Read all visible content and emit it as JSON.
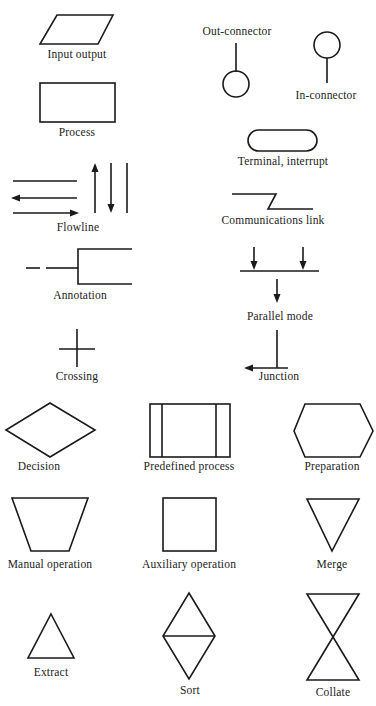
{
  "diagram": {
    "stroke_color": "#1a1a1a",
    "background": "#ffffff",
    "symbols": [
      {
        "id": "input-output",
        "label": "Input output",
        "shape": "parallelogram"
      },
      {
        "id": "out-connector",
        "label": "Out-connector",
        "shape": "line-above-circle"
      },
      {
        "id": "in-connector",
        "label": "In-connector",
        "shape": "circle-above-line"
      },
      {
        "id": "process",
        "label": "Process",
        "shape": "rectangle"
      },
      {
        "id": "terminal",
        "label": "Terminal, interrupt",
        "shape": "rounded-rectangle"
      },
      {
        "id": "flowline",
        "label": "Flowline",
        "shape": "lines-with-arrows"
      },
      {
        "id": "communications-link",
        "label": "Communications link",
        "shape": "zigzag-line"
      },
      {
        "id": "annotation",
        "label": "Annotation",
        "shape": "dashed-line-bracket"
      },
      {
        "id": "parallel-mode",
        "label": "Parallel mode",
        "shape": "arrows-to-bar"
      },
      {
        "id": "crossing",
        "label": "Crossing",
        "shape": "cross"
      },
      {
        "id": "junction",
        "label": "Junction",
        "shape": "t-junction-arrow"
      },
      {
        "id": "decision",
        "label": "Decision",
        "shape": "diamond"
      },
      {
        "id": "predefined-process",
        "label": "Predefined process",
        "shape": "rectangle-double-sides"
      },
      {
        "id": "preparation",
        "label": "Preparation",
        "shape": "hexagon"
      },
      {
        "id": "manual-operation",
        "label": "Manual operation",
        "shape": "trapezoid"
      },
      {
        "id": "auxiliary-operation",
        "label": "Auxiliary operation",
        "shape": "square"
      },
      {
        "id": "merge",
        "label": "Merge",
        "shape": "inverted-triangle"
      },
      {
        "id": "extract",
        "label": "Extract",
        "shape": "triangle"
      },
      {
        "id": "sort",
        "label": "Sort",
        "shape": "diamond-split"
      },
      {
        "id": "collate",
        "label": "Collate",
        "shape": "hourglass"
      }
    ]
  }
}
